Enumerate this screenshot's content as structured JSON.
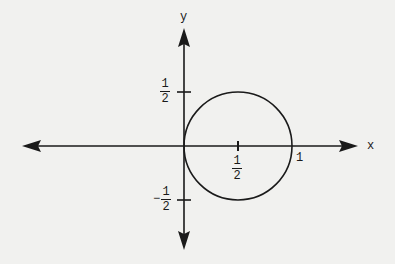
{
  "diagram": {
    "type": "coordinate-plane-circle",
    "axes": {
      "x_label": "x",
      "y_label": "y"
    },
    "circle": {
      "center": [
        0.5,
        0
      ],
      "radius": 0.5,
      "equation_hint": "circle of radius 1/2 centered at (1/2, 0)"
    },
    "tick_labels": {
      "y_pos_half": {
        "num": "1",
        "den": "2"
      },
      "y_neg_half": {
        "sign": "−",
        "num": "1",
        "den": "2"
      },
      "x_half": {
        "num": "1",
        "den": "2"
      },
      "x_one": "1"
    },
    "colors": {
      "background": "#f1f1ef",
      "ink": "#1a1a1a"
    }
  }
}
